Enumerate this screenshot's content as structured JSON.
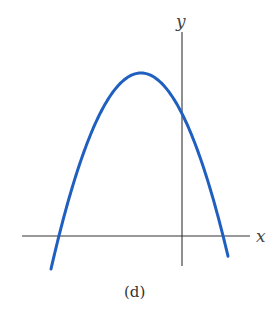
{
  "figure": {
    "caption": "(d)",
    "x_axis_label": "x",
    "y_axis_label": "y",
    "curve_color": "#1f5fbf",
    "axis_color": "#333333"
  },
  "chart_data": {
    "type": "line",
    "title": "",
    "caption": "(d)",
    "xlabel": "x",
    "ylabel": "y",
    "grid": false,
    "legend": null,
    "ticks": "none (unlabeled schematic axes)",
    "series": [
      {
        "name": "parabola",
        "shape": "concave-down quadratic",
        "vertex_sign": {
          "x": "negative",
          "y": "positive"
        },
        "y_intercept_sign": "positive",
        "roots_sign": [
          "negative",
          "positive"
        ],
        "pixel_points": [
          {
            "x": 52,
            "y": 255
          },
          {
            "x": 59,
            "y": 236
          },
          {
            "x": 80,
            "y": 183
          },
          {
            "x": 100,
            "y": 132
          },
          {
            "x": 120,
            "y": 96
          },
          {
            "x": 141,
            "y": 73
          },
          {
            "x": 160,
            "y": 82
          },
          {
            "x": 182,
            "y": 113
          },
          {
            "x": 200,
            "y": 160
          },
          {
            "x": 223,
            "y": 236
          },
          {
            "x": 227,
            "y": 252
          }
        ]
      }
    ],
    "axes_pixels": {
      "x_axis_y": 236,
      "y_axis_x": 182,
      "x_range": [
        22,
        249
      ],
      "y_range": [
        30,
        266
      ]
    }
  }
}
